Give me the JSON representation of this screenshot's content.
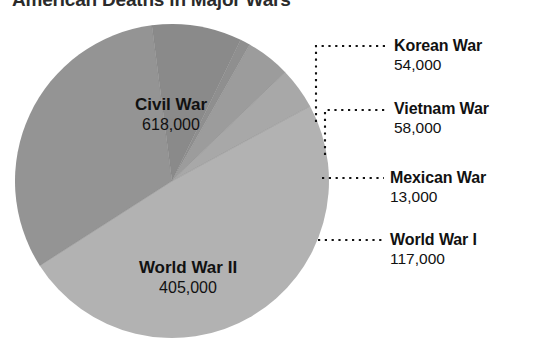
{
  "chart_data": {
    "type": "pie",
    "title": "American Deaths in Major Wars",
    "subtitle": "",
    "xlabel": "",
    "ylabel": "",
    "units": "deaths",
    "total": 1265000,
    "legend_position": "callouts-right",
    "grid": false,
    "categories": [
      "Civil War",
      "World War II",
      "World War I",
      "Vietnam War",
      "Korean War",
      "Mexican War"
    ],
    "values": [
      618000,
      405000,
      117000,
      58000,
      54000,
      13000
    ],
    "value_labels": [
      "618,000",
      "405,000",
      "117,000",
      "58,000",
      "54,000",
      "13,000"
    ],
    "slices": [
      {
        "name": "Civil War",
        "value": 618000,
        "value_label": "618,000",
        "percent": 48.9,
        "color": "#b2b2b2",
        "label_placement": "inside"
      },
      {
        "name": "World War II",
        "value": 405000,
        "value_label": "405,000",
        "percent": 32.0,
        "color": "#949494",
        "label_placement": "inside"
      },
      {
        "name": "World War I",
        "value": 117000,
        "value_label": "117,000",
        "percent": 9.2,
        "color": "#8a8a8a",
        "label_placement": "callout"
      },
      {
        "name": "Vietnam War",
        "value": 58000,
        "value_label": "58,000",
        "percent": 4.6,
        "color": "#9c9c9c",
        "label_placement": "callout"
      },
      {
        "name": "Korean War",
        "value": 54000,
        "value_label": "54,000",
        "percent": 4.3,
        "color": "#a8a8a8",
        "label_placement": "callout"
      },
      {
        "name": "Mexican War",
        "value": 13000,
        "value_label": "13,000",
        "percent": 1.0,
        "color": "#8f8f8f",
        "label_placement": "callout"
      }
    ]
  },
  "title": {
    "text": "American Deaths in Major Wars"
  },
  "pie_labels": {
    "civil_war": {
      "name": "Civil War",
      "value": "618,000"
    },
    "world_war_ii": {
      "name": "World War II",
      "value": "405,000"
    }
  },
  "callouts": {
    "korean_war": {
      "name": "Korean War",
      "value": "54,000"
    },
    "vietnam_war": {
      "name": "Vietnam War",
      "value": "58,000"
    },
    "mexican_war": {
      "name": "Mexican War",
      "value": "13,000"
    },
    "world_war_i": {
      "name": "World War I",
      "value": "117,000"
    }
  },
  "colors": {
    "background": "#ffffff",
    "text": "#111111",
    "title": "#2b2b2b",
    "leader_line": "#111111",
    "slice_light": "#b2b2b2",
    "slice_medium": "#949494",
    "slice_dark": "#8a8a8a"
  }
}
